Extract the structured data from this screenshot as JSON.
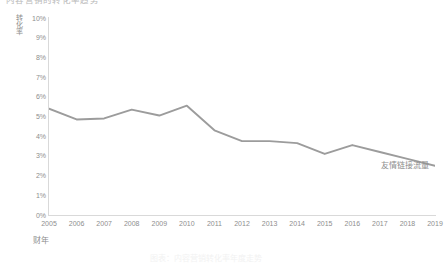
{
  "chart_data": {
    "type": "line",
    "title": "内容营销的转化率趋势",
    "categories": [
      "2005",
      "2006",
      "2007",
      "2008",
      "2009",
      "2010",
      "2011",
      "2012",
      "2013",
      "2014",
      "2015",
      "2016",
      "2017",
      "2018",
      "2019"
    ],
    "series": [
      {
        "name": "友情链接流量",
        "values": [
          5.4,
          4.85,
          4.9,
          5.35,
          5.05,
          5.55,
          4.3,
          3.75,
          3.75,
          3.65,
          3.1,
          3.55,
          3.2,
          2.85,
          2.5
        ],
        "color": "#9c9c9c"
      }
    ],
    "xlabel": "财年",
    "ylabel": "转化率",
    "ylim": [
      0,
      10
    ],
    "ytick_labels": [
      "0%",
      "1%",
      "2%",
      "3%",
      "4%",
      "5%",
      "6%",
      "7%",
      "8%",
      "9%",
      "10%"
    ],
    "ytick_values": [
      0,
      1,
      2,
      3,
      4,
      5,
      6,
      7,
      8,
      9,
      10
    ],
    "grid": false,
    "legend": "inline-end-label",
    "value_suffix": "%"
  },
  "caption": "图表：内容营销转化率年度走势",
  "colors": {
    "line": "#9c9c9c",
    "axis": "#d9d9d9",
    "text": "#8e8e8e",
    "background": "#ffffff"
  }
}
